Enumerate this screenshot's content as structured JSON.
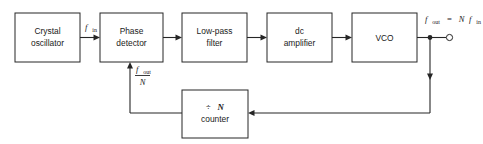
{
  "diagram": {
    "blocks": [
      {
        "id": "crystal-oscillator",
        "line1": "Crystal",
        "line2": "oscillator"
      },
      {
        "id": "phase-detector",
        "line1": "Phase",
        "line2": "detector"
      },
      {
        "id": "low-pass-filter",
        "line1": "Low-pass",
        "line2": "filter"
      },
      {
        "id": "dc-amplifier",
        "line1": "dc",
        "line2": "amplifier"
      },
      {
        "id": "vco",
        "line1": "VCO",
        "line2": ""
      },
      {
        "id": "divide-n-counter",
        "line1": "÷ N",
        "line2": "counter"
      }
    ],
    "signals": {
      "input": {
        "symbol": "f",
        "subscript": "in"
      },
      "output": {
        "left_symbol": "f",
        "left_subscript": "out",
        "equals": "=",
        "right_n": "N",
        "right_symbol": "f",
        "right_subscript": "in",
        "full_text": "f_out = Nf_in"
      },
      "feedback": {
        "numerator_symbol": "f",
        "numerator_subscript": "out",
        "denominator": "N",
        "full_text": "f_out / N"
      }
    },
    "divider": {
      "symbol": "÷",
      "factor": "N",
      "label": "counter"
    },
    "colors": {
      "line": "#262626",
      "text": "#1a1a1a",
      "background": "#ffffff",
      "box_fill": "#ffffff"
    }
  }
}
